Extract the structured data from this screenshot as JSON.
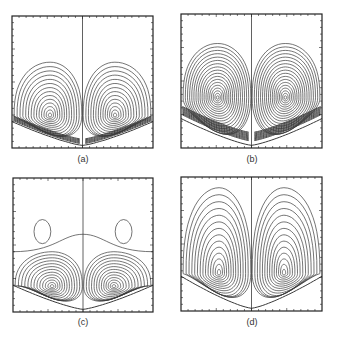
{
  "figure": {
    "panels": [
      {
        "id": "a",
        "label": "(a)",
        "box": {
          "x": 12,
          "y": 16,
          "w": 141,
          "h": 132
        },
        "label_pos": {
          "x": 83,
          "y": 154
        },
        "vortex_center": {
          "rx": 0.27,
          "ry": 0.755
        },
        "n_contours": 14,
        "outer_top": 0.35,
        "outer_span": 0.46,
        "bottom_curve": {
          "edge_y": 0.8,
          "mid_y": 0.98
        },
        "dense_band": true,
        "band_lines": 6,
        "second_cell": false
      },
      {
        "id": "b",
        "label": "(b)",
        "box": {
          "x": 181,
          "y": 14,
          "w": 141,
          "h": 134
        },
        "label_pos": {
          "x": 252,
          "y": 154
        },
        "vortex_center": {
          "rx": 0.26,
          "ry": 0.625
        },
        "n_contours": 18,
        "outer_top": 0.22,
        "outer_span": 0.47,
        "bottom_curve": {
          "edge_y": 0.78,
          "mid_y": 0.98
        },
        "dense_band": true,
        "band_lines": 10,
        "second_cell": false
      },
      {
        "id": "c",
        "label": "(c)",
        "box": {
          "x": 13,
          "y": 178,
          "w": 140,
          "h": 134
        },
        "label_pos": {
          "x": 83,
          "y": 317
        },
        "vortex_center": {
          "rx": 0.28,
          "ry": 0.81
        },
        "n_contours": 13,
        "outer_top": 0.55,
        "outer_span": 0.47,
        "bottom_curve": {
          "edge_y": 0.8,
          "mid_y": 0.98
        },
        "dense_band": false,
        "band_lines": 0,
        "second_cell": true,
        "second_cell_shape": {
          "rx": 0.21,
          "ry": 0.4,
          "a": 0.06,
          "b": 0.09
        },
        "separatrix": {
          "edge_y": 0.55,
          "mid_y": 0.42
        }
      },
      {
        "id": "d",
        "label": "(d)",
        "box": {
          "x": 181,
          "y": 177,
          "w": 141,
          "h": 134
        },
        "label_pos": {
          "x": 252,
          "y": 317
        },
        "vortex_center": {
          "rx": 0.27,
          "ry": 0.72
        },
        "n_contours": 14,
        "outer_top": 0.08,
        "outer_span": 0.48,
        "bottom_curve": {
          "edge_y": 0.74,
          "mid_y": 0.98
        },
        "dense_band": false,
        "band_lines": 0,
        "second_cell": false
      }
    ],
    "style": {
      "line_color": "#3a3a3a",
      "frame_color": "#222222",
      "tick_count_x": 20,
      "tick_count_y": 20
    }
  }
}
